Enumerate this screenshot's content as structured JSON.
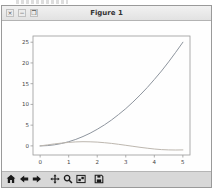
{
  "window": {
    "title": "Figure 1",
    "controls": [
      {
        "id": "close",
        "glyph": "×"
      },
      {
        "id": "minimize",
        "glyph": "−"
      },
      {
        "id": "maximize",
        "glyph": "❒"
      }
    ]
  },
  "toolbar": {
    "buttons": [
      {
        "id": "home",
        "icon": "home-icon"
      },
      {
        "id": "back",
        "icon": "arrow-left-icon"
      },
      {
        "id": "forward",
        "icon": "arrow-right-icon"
      },
      {
        "id": "pan",
        "icon": "move-icon"
      },
      {
        "id": "zoom",
        "icon": "magnifier-icon"
      },
      {
        "id": "subplots",
        "icon": "subplots-icon"
      },
      {
        "id": "save",
        "icon": "floppy-icon"
      }
    ]
  },
  "colors": {
    "curve1": "#8e959e",
    "curve2": "#bdb7af",
    "axis": "#9a9a9a",
    "tick_label": "#444444",
    "toolbar_bg": "#d8d8d8",
    "titlebar_bg": "#ececec",
    "icon": "#1a1a1a"
  },
  "chart_data": {
    "type": "line",
    "title": "",
    "xlabel": "",
    "ylabel": "",
    "grid": false,
    "legend": null,
    "xlim": [
      -0.25,
      5.25
    ],
    "ylim": [
      -2.2,
      26.5
    ],
    "xticks": [
      0,
      1,
      2,
      3,
      4,
      5
    ],
    "yticks": [
      0,
      5,
      10,
      15,
      20,
      25
    ],
    "x": [
      0,
      0.25,
      0.5,
      0.75,
      1,
      1.25,
      1.5,
      1.75,
      2,
      2.25,
      2.5,
      2.75,
      3,
      3.25,
      3.5,
      3.75,
      4,
      4.25,
      4.5,
      4.75,
      5
    ],
    "series": [
      {
        "name": "curve-1",
        "color": "#8e959e",
        "values": [
          0,
          0.0625,
          0.25,
          0.5625,
          1,
          1.5625,
          2.25,
          3.0625,
          4,
          5.0625,
          6.25,
          7.5625,
          9,
          10.5625,
          12.25,
          14.0625,
          16,
          18.0625,
          20.25,
          22.5625,
          25
        ]
      },
      {
        "name": "curve-2",
        "color": "#bdb7af",
        "values": [
          0,
          0.247,
          0.479,
          0.682,
          0.841,
          0.949,
          0.997,
          0.984,
          0.909,
          0.778,
          0.599,
          0.382,
          0.141,
          -0.108,
          -0.351,
          -0.572,
          -0.757,
          -0.895,
          -0.978,
          -0.999,
          -0.959
        ]
      }
    ]
  }
}
